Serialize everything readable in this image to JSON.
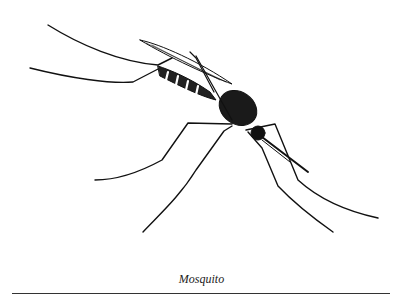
{
  "figure": {
    "caption": "Mosquito",
    "colors": {
      "ink": "#111111",
      "background": "#ffffff",
      "rule": "#333333"
    }
  }
}
